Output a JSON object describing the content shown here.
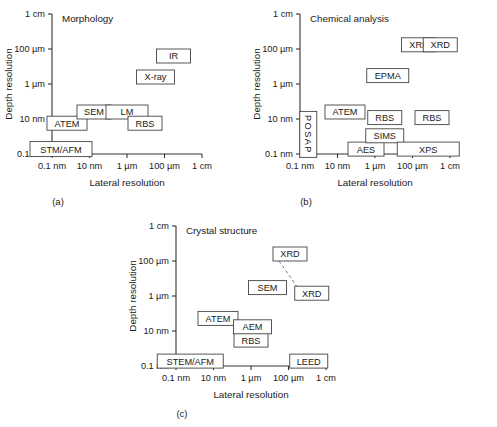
{
  "figure": {
    "axis_titles": {
      "x": "Lateral resolution",
      "y": "Depth resolution"
    },
    "x_ticks": [
      "0.1 nm",
      "10 nm",
      "1 µm",
      "100 µm",
      "1 cm"
    ],
    "y_ticks": [
      "1 cm",
      "100 µm",
      "1 µm",
      "10 nm",
      "0.1 nm"
    ]
  },
  "chart_data": {
    "type": "scatter",
    "xlabel": "Lateral resolution",
    "ylabel": "Depth resolution",
    "xlim": [
      "0.1 nm",
      "1 cm"
    ],
    "ylim": [
      "0.1 nm",
      "1 cm"
    ],
    "x_tick_labels": [
      "0.1 nm",
      "10 nm",
      "1 µm",
      "100 µm",
      "1 cm"
    ],
    "y_tick_labels": [
      "1 cm",
      "100 µm",
      "1 µm",
      "10 nm",
      "0.1 nm"
    ],
    "grid": false,
    "legend": "none",
    "panels": [
      {
        "id": "a",
        "caption": "(a)",
        "title": "Morphology",
        "points": [
          {
            "label": "STM/AFM",
            "x": 0.06,
            "y": 0.035,
            "w": 62,
            "h": 15,
            "orient": "horizontal"
          },
          {
            "label": "ATEM",
            "x": 0.1,
            "y": 0.22,
            "w": 40,
            "h": 14,
            "orient": "horizontal"
          },
          {
            "label": "SEM",
            "x": 0.28,
            "y": 0.3,
            "w": 34,
            "h": 14,
            "orient": "horizontal"
          },
          {
            "label": "LM",
            "x": 0.5,
            "y": 0.3,
            "w": 42,
            "h": 14,
            "orient": "horizontal"
          },
          {
            "label": "RBS",
            "x": 0.62,
            "y": 0.22,
            "w": 34,
            "h": 14,
            "orient": "horizontal"
          },
          {
            "label": "X-ray",
            "x": 0.69,
            "y": 0.55,
            "w": 38,
            "h": 14,
            "orient": "horizontal"
          },
          {
            "label": "IR",
            "x": 0.81,
            "y": 0.7,
            "w": 34,
            "h": 14,
            "orient": "horizontal"
          }
        ],
        "connectors": []
      },
      {
        "id": "b",
        "caption": "(b)",
        "title": "Chemical analysis",
        "points": [
          {
            "label": "POSAP",
            "x": 0.055,
            "y": 0.14,
            "w": 17,
            "h": 46,
            "orient": "vertical"
          },
          {
            "label": "ATEM",
            "x": 0.3,
            "y": 0.3,
            "w": 40,
            "h": 14,
            "orient": "horizontal"
          },
          {
            "label": "AES",
            "x": 0.44,
            "y": 0.035,
            "w": 36,
            "h": 14,
            "orient": "horizontal"
          },
          {
            "label": "SIMS",
            "x": 0.565,
            "y": 0.13,
            "w": 38,
            "h": 14,
            "orient": "horizontal"
          },
          {
            "label": "RBS",
            "x": 0.565,
            "y": 0.26,
            "w": 34,
            "h": 14,
            "orient": "horizontal"
          },
          {
            "label": "EPMA",
            "x": 0.585,
            "y": 0.56,
            "w": 42,
            "h": 14,
            "orient": "horizontal"
          },
          {
            "label": "XRF",
            "x": 0.79,
            "y": 0.78,
            "w": 34,
            "h": 14,
            "orient": "horizontal"
          },
          {
            "label": "XPS",
            "x": 0.855,
            "y": 0.035,
            "w": 62,
            "h": 14,
            "orient": "horizontal"
          },
          {
            "label": "RBS",
            "x": 0.88,
            "y": 0.26,
            "w": 34,
            "h": 14,
            "orient": "horizontal"
          },
          {
            "label": "XRD",
            "x": 0.935,
            "y": 0.78,
            "w": 34,
            "h": 14,
            "orient": "horizontal"
          }
        ],
        "connectors": []
      },
      {
        "id": "c",
        "caption": "(c)",
        "title": "Crystal structure",
        "points": [
          {
            "label": "STEM/AFM",
            "x": 0.095,
            "y": 0.035,
            "w": 66,
            "h": 14,
            "orient": "horizontal"
          },
          {
            "label": "ATEM",
            "x": 0.28,
            "y": 0.34,
            "w": 40,
            "h": 14,
            "orient": "horizontal"
          },
          {
            "label": "RBS",
            "x": 0.5,
            "y": 0.185,
            "w": 34,
            "h": 14,
            "orient": "horizontal"
          },
          {
            "label": "AEM",
            "x": 0.51,
            "y": 0.28,
            "w": 38,
            "h": 14,
            "orient": "horizontal"
          },
          {
            "label": "SEM",
            "x": 0.61,
            "y": 0.56,
            "w": 38,
            "h": 14,
            "orient": "horizontal"
          },
          {
            "label": "XRD",
            "x": 0.76,
            "y": 0.8,
            "w": 34,
            "h": 14,
            "orient": "horizontal"
          },
          {
            "label": "XRD",
            "x": 0.905,
            "y": 0.52,
            "w": 34,
            "h": 14,
            "orient": "horizontal"
          },
          {
            "label": "LEED",
            "x": 0.885,
            "y": 0.035,
            "w": 38,
            "h": 14,
            "orient": "horizontal"
          }
        ],
        "connectors": [
          {
            "from": 5,
            "to": 6
          }
        ]
      }
    ]
  }
}
